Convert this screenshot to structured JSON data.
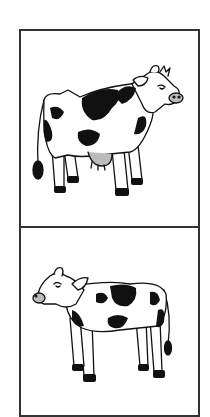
{
  "figure": {
    "panels": [
      {
        "label": "adult-cow",
        "description": "Adult dairy cow with black spots, facing right, udder visible",
        "facing": "right"
      },
      {
        "label": "calf",
        "description": "Young calf with black spots, facing left",
        "facing": "left"
      }
    ],
    "colors": {
      "border": "#333333",
      "outline": "#111111",
      "spots": "#111111",
      "udder": "#bbbbbb",
      "nose": "#bbbbbb",
      "background": "#ffffff"
    }
  }
}
